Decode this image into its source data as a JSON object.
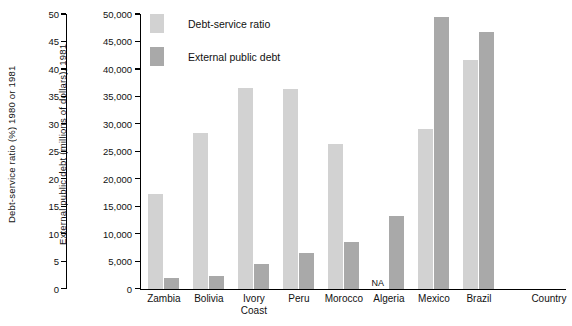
{
  "axes": {
    "left_title": "Debt-service ratio (%) 1980 or 1981",
    "right_title": "External public debt (millions of dollars), 1981",
    "x_title": "Country",
    "left_ticks": [
      "50",
      "45",
      "40",
      "35",
      "30",
      "25",
      "20",
      "15",
      "10",
      "5",
      "0"
    ],
    "right_ticks": [
      "50,000",
      "45,000",
      "40,000",
      "35,000",
      "30,000",
      "25,000",
      "20,000",
      "15,000",
      "10,000",
      "5,000",
      "0"
    ]
  },
  "legend": {
    "items": [
      {
        "label": "Debt-service ratio",
        "color": "#d2d2d2"
      },
      {
        "label": "External public debt",
        "color": "#a9a9a9"
      }
    ]
  },
  "na_text": "NA",
  "colors": {
    "debt_service_ratio": "#d2d2d2",
    "external_public_debt": "#a9a9a9",
    "axis": "#000000",
    "background": "#ffffff"
  },
  "chart_data": {
    "type": "bar",
    "title": "",
    "xlabel": "Country",
    "categories": [
      "Zambia",
      "Bolivia",
      "Ivory\nCoast",
      "Peru",
      "Morocco",
      "Algeria",
      "Mexico",
      "Brazil"
    ],
    "series": [
      {
        "name": "Debt-service ratio",
        "axis": "left",
        "unit": "%",
        "ylim": [
          0,
          50
        ],
        "values": [
          17.3,
          28.3,
          36.6,
          36.3,
          26.4,
          null,
          29.1,
          41.6
        ],
        "missing_label": "NA"
      },
      {
        "name": "External public debt",
        "axis": "right",
        "unit": "millions of dollars",
        "ylim": [
          0,
          50000
        ],
        "values": [
          2000,
          2300,
          4400,
          6400,
          8500,
          13300,
          49500,
          46800
        ]
      }
    ],
    "ylabel": "Debt-service ratio (%) 1980 or 1981",
    "ylabel_right": "External public debt (millions of dollars), 1981",
    "grid": false,
    "legend_position": "top-left-inside"
  }
}
